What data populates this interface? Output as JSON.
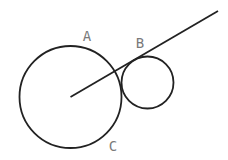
{
  "diagram": {
    "type": "geometry",
    "canvas": {
      "width": 228,
      "height": 160,
      "background": "#ffffff"
    },
    "stroke_color": "#222222",
    "label_color": "#7a7a7a",
    "circles": [
      {
        "id": "large-circle",
        "cx": 70.5,
        "cy": 97,
        "r": 51
      },
      {
        "id": "small-circle",
        "cx": 147.5,
        "cy": 82.5,
        "r": 26
      }
    ],
    "line": {
      "id": "tangent-ray",
      "x1": 70.5,
      "y1": 97,
      "x2": 218,
      "y2": 11
    },
    "labels": [
      {
        "text": "A",
        "x": 87,
        "y": 36
      },
      {
        "text": "B",
        "x": 140,
        "y": 43
      },
      {
        "text": "C",
        "x": 113,
        "y": 146
      }
    ]
  }
}
